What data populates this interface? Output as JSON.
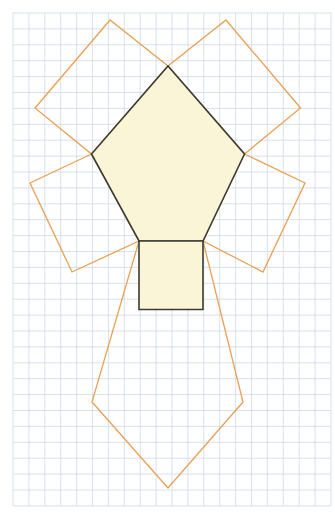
{
  "figure": {
    "canvas": {
      "width": 335,
      "height": 520,
      "background": "#ffffff"
    },
    "grid": {
      "name": "graph-paper-grid",
      "origin_x": 13,
      "origin_y": 13,
      "cell_size": 15.9,
      "columns": 20,
      "rows": 31,
      "minor_color": "#c7d4e6",
      "major_color": "#b9c6da",
      "major_every": 0,
      "visible": true
    },
    "colors": {
      "pentagon_stroke": "#3b3b32",
      "pentagon_fill": "#fbf5d7",
      "square_stroke": "#e8a053",
      "square_fill": "none",
      "base_square_stroke": "#3b3b32",
      "base_square_fill": "#fbf5d7"
    },
    "stroke_widths": {
      "pentagon": 1.6,
      "square": 1.3,
      "base_square": 1.6
    },
    "pentagon": {
      "name": "central-pentagon",
      "sides": 5,
      "regular": true,
      "vertices": [
        {
          "label": "apex-top",
          "x": 168.0,
          "y": 66.0
        },
        {
          "label": "upper-right",
          "x": 244.5,
          "y": 154.0
        },
        {
          "label": "lower-right",
          "x": 203.0,
          "y": 241.0
        },
        {
          "label": "lower-left",
          "x": 139.0,
          "y": 241.0
        },
        {
          "label": "upper-left",
          "x": 91.5,
          "y": 154.0
        }
      ],
      "points_attr": "168.0,66.0 244.5,154.0 203.0,241.0 139.0,241.0 91.5,154.0"
    },
    "squares": [
      {
        "name": "square-on-bottom-side",
        "on_side": "bottom",
        "stroke": "#e8a053",
        "filled": false,
        "vertices": [
          {
            "x": 139.0,
            "y": 241.0
          },
          {
            "x": 203.0,
            "y": 241.0
          },
          {
            "x": 243.0,
            "y": 402.0
          },
          {
            "x": 168.0,
            "y": 488.0
          },
          {
            "x": 92.0,
            "y": 402.0
          }
        ],
        "points_attr": "139.0,241.0 92.0,402.0 168.0,488.0 243.0,402.0 203.0,241.0"
      },
      {
        "name": "square-on-lower-left-side",
        "on_side": "lower-left",
        "stroke": "#e8a053",
        "filled": false,
        "points_attr": "91.5,154.0 30.0,183.0 72.0,272.0 139.0,241.0"
      },
      {
        "name": "square-on-lower-right-side",
        "on_side": "lower-right",
        "stroke": "#e8a053",
        "filled": false,
        "points_attr": "244.5,154.0 305.0,183.0 263.0,272.0 203.0,241.0"
      },
      {
        "name": "square-on-upper-left-side",
        "on_side": "upper-left",
        "stroke": "#e8a053",
        "filled": false,
        "points_attr": "168.0,66.0 110.0,20.0 35.0,108.0 91.5,154.0"
      },
      {
        "name": "square-on-upper-right-side",
        "on_side": "upper-right",
        "stroke": "#e8a053",
        "filled": false,
        "points_attr": "168.0,66.0 226.0,20.0 300.5,108.0 244.5,154.0"
      }
    ],
    "base_square": {
      "name": "highlighted-base-square",
      "note": "portion of the bottom square adjacent to the pentagon, drawn dark and filled",
      "x": 139.0,
      "y": 241.0,
      "width": 64.0,
      "height": 68.5,
      "points_attr": "139.0,241.0 203.0,241.0 203.0,309.5 139.0,309.5"
    }
  }
}
